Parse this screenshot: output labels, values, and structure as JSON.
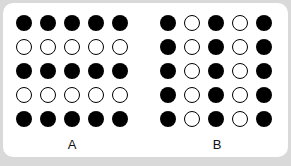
{
  "panels": [
    {
      "label": "A",
      "rows": [
        [
          1,
          1,
          1,
          1,
          1
        ],
        [
          0,
          0,
          0,
          0,
          0
        ],
        [
          1,
          1,
          1,
          1,
          1
        ],
        [
          0,
          0,
          0,
          0,
          0
        ],
        [
          1,
          1,
          1,
          1,
          1
        ]
      ]
    },
    {
      "label": "B",
      "rows": [
        [
          1,
          0,
          1,
          0,
          1
        ],
        [
          1,
          0,
          1,
          0,
          1
        ],
        [
          1,
          0,
          1,
          0,
          1
        ],
        [
          1,
          0,
          1,
          0,
          1
        ],
        [
          1,
          0,
          1,
          0,
          1
        ]
      ]
    }
  ],
  "colors": {
    "filled": "#000000",
    "empty": "#ffffff",
    "background": "#d9d9d9",
    "card": "#ffffff"
  }
}
